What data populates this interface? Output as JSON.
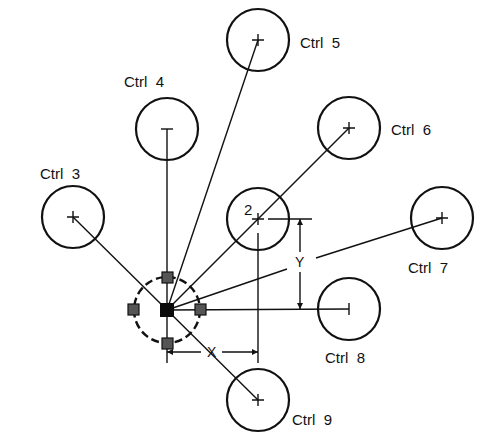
{
  "diagram": {
    "title": "",
    "center_node": {
      "x": 167,
      "y": 310,
      "grip_radius": 33
    },
    "reference_circle": {
      "label": "2",
      "x": 258,
      "y": 219,
      "r": 31
    },
    "controls": [
      {
        "id": "ctrl3",
        "label": "Ctrl  3",
        "x": 73,
        "y": 217,
        "r": 31
      },
      {
        "id": "ctrl4",
        "label": "Ctrl  4",
        "x": 167,
        "y": 129,
        "r": 31
      },
      {
        "id": "ctrl5",
        "label": "Ctrl  5",
        "x": 258,
        "y": 40,
        "r": 31
      },
      {
        "id": "ctrl6",
        "label": "Ctrl  6",
        "x": 349,
        "y": 128,
        "r": 31
      },
      {
        "id": "ctrl7",
        "label": "Ctrl  7",
        "x": 442,
        "y": 218,
        "r": 31
      },
      {
        "id": "ctrl8",
        "label": "Ctrl  8",
        "x": 349,
        "y": 309,
        "r": 31
      },
      {
        "id": "ctrl9",
        "label": "Ctrl  9",
        "x": 258,
        "y": 400,
        "r": 31
      }
    ],
    "dimensions": {
      "x_label": "X",
      "y_label": "Y"
    }
  }
}
